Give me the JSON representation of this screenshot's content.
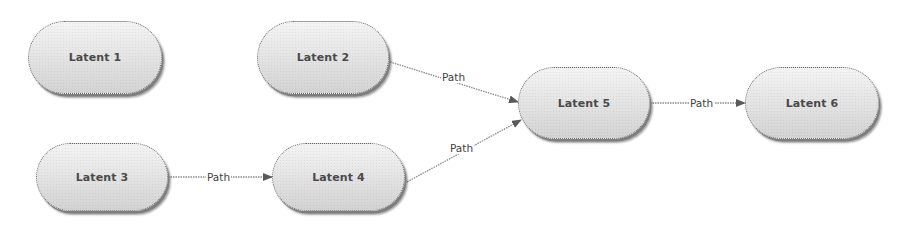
{
  "diagram": {
    "nodes": [
      {
        "id": "latent1",
        "label": "Latent 1"
      },
      {
        "id": "latent2",
        "label": "Latent 2"
      },
      {
        "id": "latent3",
        "label": "Latent 3"
      },
      {
        "id": "latent4",
        "label": "Latent 4"
      },
      {
        "id": "latent5",
        "label": "Latent 5"
      },
      {
        "id": "latent6",
        "label": "Latent 6"
      }
    ],
    "edges": [
      {
        "from": "latent2",
        "to": "latent5",
        "label": "Path"
      },
      {
        "from": "latent3",
        "to": "latent4",
        "label": "Path"
      },
      {
        "from": "latent4",
        "to": "latent5",
        "label": "Path"
      },
      {
        "from": "latent5",
        "to": "latent6",
        "label": "Path"
      }
    ]
  }
}
